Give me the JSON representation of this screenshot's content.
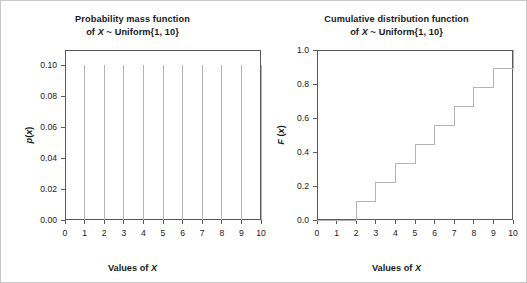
{
  "figure": {
    "background": "#ffffff",
    "border_color": "#c8c8c8",
    "axis_color": "#5a5a5a",
    "data_color": "#b4b4b4",
    "text_color": "#1a1a1a"
  },
  "panels": [
    {
      "id": "pmf",
      "title_line1": "Probability mass function",
      "title_line2_prefix": "of ",
      "title_line2_var": "X",
      "title_line2_suffix": " ~ Uniform{1, 10}",
      "xlabel_prefix": "Values of ",
      "xlabel_var": "X",
      "ylabel_prefix": "p",
      "ylabel_paren_open": "(",
      "ylabel_var": "x",
      "ylabel_paren_close": ")",
      "yticks": [
        "0.00",
        "0.02",
        "0.04",
        "0.06",
        "0.08",
        "0.10"
      ],
      "xticks": [
        "0",
        "1",
        "2",
        "3",
        "4",
        "5",
        "6",
        "7",
        "8",
        "9",
        "10"
      ]
    },
    {
      "id": "cdf",
      "title_line1": "Cumulative distribution function",
      "title_line2_prefix": "of ",
      "title_line2_var": "X",
      "title_line2_suffix": " ~ Uniform{1, 10}",
      "xlabel_prefix": "Values of ",
      "xlabel_var": "X",
      "ylabel_prefix": "F",
      "ylabel_paren_open": " (",
      "ylabel_var": "x",
      "ylabel_paren_close": ")",
      "yticks": [
        "0.0",
        "0.2",
        "0.4",
        "0.6",
        "0.8",
        "1.0"
      ],
      "xticks": [
        "0",
        "1",
        "2",
        "3",
        "4",
        "5",
        "6",
        "7",
        "8",
        "9",
        "10"
      ]
    }
  ],
  "chart_data": [
    {
      "type": "bar",
      "subtype": "spike",
      "title": "Probability mass function of X ~ Uniform{1, 10}",
      "xlabel": "Values of X",
      "ylabel": "p(x)",
      "x": [
        1,
        2,
        3,
        4,
        5,
        6,
        7,
        8,
        9,
        10
      ],
      "values": [
        0.1,
        0.1,
        0.1,
        0.1,
        0.1,
        0.1,
        0.1,
        0.1,
        0.1,
        0.1
      ],
      "xlim": [
        0,
        10
      ],
      "ylim": [
        0,
        0.11
      ],
      "ytick_values": [
        0.0,
        0.02,
        0.04,
        0.06,
        0.08,
        0.1
      ],
      "xtick_values": [
        0,
        1,
        2,
        3,
        4,
        5,
        6,
        7,
        8,
        9,
        10
      ],
      "grid": false,
      "legend": false
    },
    {
      "type": "line",
      "subtype": "step",
      "title": "Cumulative distribution function of X ~ Uniform{1, 10}",
      "xlabel": "Values of X",
      "ylabel": "F (x)",
      "x": [
        0,
        1,
        2,
        3,
        4,
        5,
        6,
        7,
        8,
        9,
        10
      ],
      "values": [
        0.0,
        0.0,
        0.111,
        0.222,
        0.333,
        0.444,
        0.556,
        0.667,
        0.778,
        0.889,
        1.0
      ],
      "xlim": [
        0,
        10
      ],
      "ylim": [
        0,
        1.0
      ],
      "ytick_values": [
        0.0,
        0.2,
        0.4,
        0.6,
        0.8,
        1.0
      ],
      "xtick_values": [
        0,
        1,
        2,
        3,
        4,
        5,
        6,
        7,
        8,
        9,
        10
      ],
      "grid": false,
      "legend": false
    }
  ]
}
